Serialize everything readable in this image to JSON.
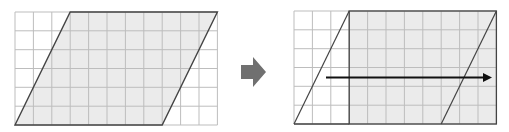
{
  "diagram": {
    "grid": {
      "columns": 11,
      "rows": 6,
      "line_color": "#bdbdbd",
      "cell_w": 18.4,
      "cell_h": 18.8
    },
    "colors": {
      "shade": "#ebebeb",
      "outline": "#444444",
      "transform_arrow": "#707070",
      "shift_arrow": "#111111"
    },
    "left_panel": {
      "label": "parallelogram",
      "top_left_col": 3,
      "top_right_col": 11,
      "bottom_left_col": 0,
      "bottom_right_col": 8
    },
    "transform_arrow": {
      "icon": "right-arrow-icon"
    },
    "right_panel": {
      "label": "rectangle",
      "rect_from_col": 3,
      "rect_to_col": 11,
      "moved_triangle": "left triangle translated 8 columns right"
    }
  }
}
